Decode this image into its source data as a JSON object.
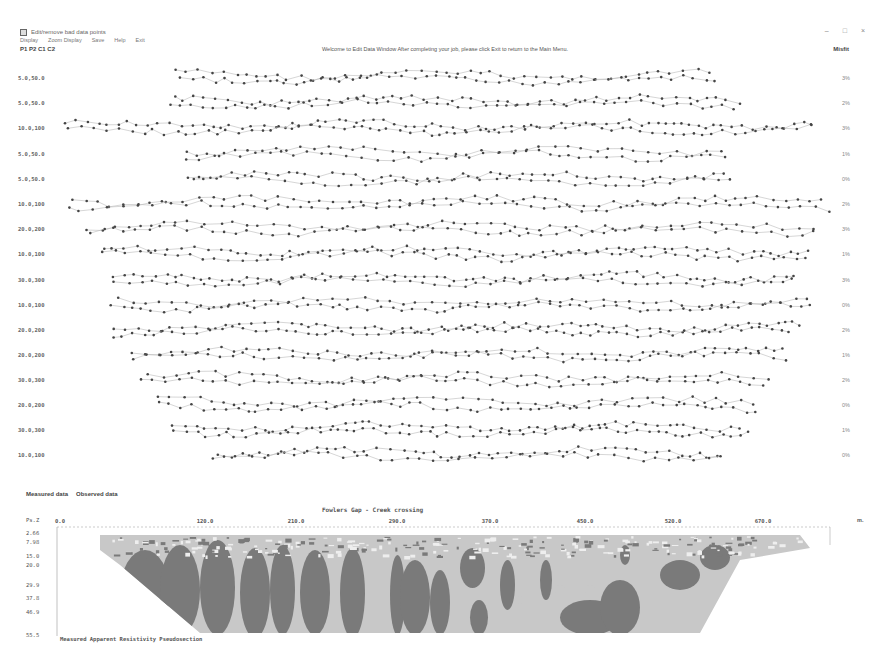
{
  "window": {
    "title": "Edit/remove bad data points",
    "controls": [
      "minimize",
      "maximize",
      "close"
    ]
  },
  "menu": {
    "items": [
      {
        "label": "Display"
      },
      {
        "label": "Zoom Display"
      },
      {
        "label": "Save"
      },
      {
        "label": "Help"
      },
      {
        "label": "Exit"
      }
    ]
  },
  "header": {
    "config_label": "P1 P2 C1 C2",
    "welcome_message": "Welcome to Edit Data Window After completing your job, please click Exit to return to the Main Menu.",
    "misfit_title": "Misfit"
  },
  "profile_rows": [
    {
      "label": "5.0,50.0",
      "misfit": "3%",
      "y": 78
    },
    {
      "label": "5.0,50.0",
      "misfit": "2%",
      "y": 103
    },
    {
      "label": "10.0,100",
      "misfit": "3%",
      "y": 128
    },
    {
      "label": "5.0,50.0",
      "misfit": "1%",
      "y": 154
    },
    {
      "label": "5.0,50.0",
      "misfit": "0%",
      "y": 179
    },
    {
      "label": "10.0,100",
      "misfit": "2%",
      "y": 204
    },
    {
      "label": "20.0,200",
      "misfit": "3%",
      "y": 229
    },
    {
      "label": "10.0,100",
      "misfit": "1%",
      "y": 254
    },
    {
      "label": "30.0,300",
      "misfit": "3%",
      "y": 280
    },
    {
      "label": "10.0,100",
      "misfit": "0%",
      "y": 305
    },
    {
      "label": "20.0,200",
      "misfit": "2%",
      "y": 330
    },
    {
      "label": "20.0,200",
      "misfit": "1%",
      "y": 355
    },
    {
      "label": "30.0,300",
      "misfit": "2%",
      "y": 380
    },
    {
      "label": "20.0,200",
      "misfit": "0%",
      "y": 405
    },
    {
      "label": "30.0,300",
      "misfit": "1%",
      "y": 430
    },
    {
      "label": "10.0,100",
      "misfit": "0%",
      "y": 455
    }
  ],
  "legend": {
    "measured": "Measured data",
    "observed": "Observed data"
  },
  "pseudosection": {
    "title": "Fowlers Gap - Creek crossing",
    "unit_left": "Ps.Z",
    "unit_right": "m.",
    "x_ticks": [
      {
        "label": "0.0",
        "x": 60
      },
      {
        "label": "120.0",
        "x": 205
      },
      {
        "label": "210.0",
        "x": 296
      },
      {
        "label": "290.0",
        "x": 397
      },
      {
        "label": "370.0",
        "x": 490
      },
      {
        "label": "450.0",
        "x": 585
      },
      {
        "label": "520.0",
        "x": 673
      },
      {
        "label": "670.0",
        "x": 763
      }
    ],
    "depth_ticks": [
      {
        "label": "2.66",
        "y": 533
      },
      {
        "label": "7.98",
        "y": 542
      },
      {
        "label": "15.0",
        "y": 556
      },
      {
        "label": "20.0",
        "y": 565
      },
      {
        "label": "29.9",
        "y": 585
      },
      {
        "label": "37.8",
        "y": 598
      },
      {
        "label": "46.9",
        "y": 612
      },
      {
        "label": "55.5",
        "y": 635
      }
    ],
    "caption": "Measured Apparent Resistivity Pseudosection",
    "colors": {
      "light": "#c8c8c8",
      "dark": "#7a7a7a"
    }
  }
}
